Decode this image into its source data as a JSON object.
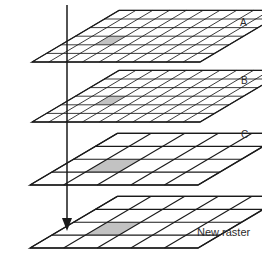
{
  "figure": {
    "title_fragment": "",
    "background_color": "#ffffff",
    "line_color": "#1a1a1a",
    "shade_color": "#c2c2c2",
    "arrow_color": "#1a1a1a"
  },
  "layers": [
    {
      "id": "layer-a",
      "label": "A",
      "label_x": 240,
      "label_y": 26,
      "grid_cols": 10,
      "grid_rows": 6,
      "origin_x": 32,
      "origin_y": 62,
      "cell_w": 16.8,
      "cell_h": 0,
      "skew_x": 14.5,
      "skew_y": -8.6,
      "shaded_cell_col": 2,
      "shaded_cell_row": 2,
      "resolution": "fine"
    },
    {
      "id": "layer-b",
      "label": "B",
      "label_x": 241,
      "label_y": 84,
      "grid_cols": 10,
      "grid_rows": 6,
      "origin_x": 32,
      "origin_y": 122,
      "cell_w": 16.8,
      "cell_h": 0,
      "skew_x": 14.5,
      "skew_y": -8.6,
      "shaded_cell_col": 2,
      "shaded_cell_row": 2,
      "resolution": "fine"
    },
    {
      "id": "layer-c",
      "label": "C",
      "label_x": 241,
      "label_y": 138,
      "grid_cols": 5,
      "grid_rows": 4,
      "origin_x": 30,
      "origin_y": 185,
      "cell_w": 33.6,
      "cell_h": 0,
      "skew_x": 21.8,
      "skew_y": -12.9,
      "shaded_cell_col": 1,
      "shaded_cell_row": 1,
      "resolution": "coarse"
    },
    {
      "id": "layer-new-raster",
      "label": "New raster",
      "label_x": 197,
      "label_y": 236,
      "grid_cols": 5,
      "grid_rows": 4,
      "origin_x": 30,
      "origin_y": 248,
      "cell_w": 33.6,
      "cell_h": 0,
      "skew_x": 21.8,
      "skew_y": -12.9,
      "shaded_cell_col": 1,
      "shaded_cell_row": 1,
      "resolution": "coarse"
    }
  ],
  "arrow": {
    "name": "vertical-resample-arrow",
    "x": 67,
    "y_start": 5,
    "y_end": 231,
    "head_width": 10,
    "head_height": 13
  }
}
